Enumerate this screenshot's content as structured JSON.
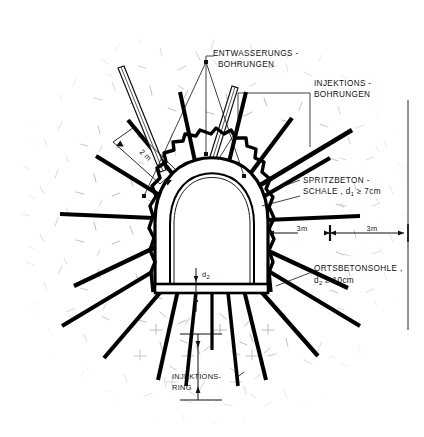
{
  "drawing": {
    "type": "tunnel-cross-section",
    "language": "de",
    "title_visible": false,
    "colors": {
      "ink": "#111111",
      "lining": "#000000",
      "hatch": "#b9b9b9",
      "paper": "#ffffff"
    }
  },
  "labels": {
    "drainage": {
      "line1": "ENTWASSERUNGS -",
      "line2": "BOHRUNGEN"
    },
    "injection": {
      "line1": "INJEKTIONS -",
      "line2": "BOHRUNGEN"
    },
    "shotcrete": {
      "line1": "SPRITZBETON -",
      "line2_pre": "SCHALE , d",
      "line2_sub": "1",
      "line2_post": " ≥ 7cm"
    },
    "invert": {
      "line1": "ORTSBETONSOHLE ,",
      "line2_pre": "d",
      "line2_sub": "2",
      "line2_post": " ≥ 10cm"
    },
    "injection_ring": {
      "line1": "INJEKTIONS-",
      "line2": "RING"
    }
  },
  "dimensions": {
    "left_span": "3m",
    "right_span": "3m",
    "bolt_length": "2 m",
    "invert_thickness_pre": "d",
    "invert_thickness_sub": "2"
  },
  "legend_terms": [
    "ENTWASSERUNGS - BOHRUNGEN",
    "INJEKTIONS - BOHRUNGEN",
    "SPRITZBETON - SCHALE",
    "ORTSBETONSOHLE",
    "INJEKTIONS- RING"
  ]
}
